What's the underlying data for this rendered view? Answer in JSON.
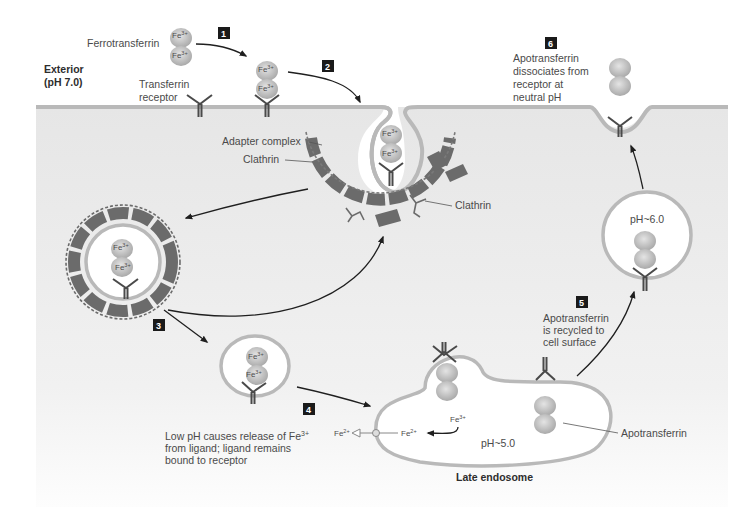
{
  "figure": {
    "regions": {
      "exterior_label_line1": "Exterior",
      "exterior_label_line2": "(pH 7.0)",
      "late_endosome_label": "Late endosome"
    },
    "labels": {
      "ferrotransferrin": "Ferrotransferrin",
      "transferrin_receptor_line1": "Transferrin",
      "transferrin_receptor_line2": "receptor",
      "adapter_complex": "Adapter complex",
      "clathrin_pit": "Clathrin",
      "clathrin_free": "Clathrin",
      "apotransferrin": "Apotransferrin",
      "ph_endosome": "pH~5.0",
      "ph_recycling": "pH~6.0",
      "fe3": "Fe",
      "fe3_sup": "3+",
      "fe2": "Fe",
      "fe2_sup": "2+"
    },
    "steps": [
      {
        "number": "1"
      },
      {
        "number": "2"
      },
      {
        "number": "3"
      },
      {
        "number": "4",
        "caption_lines": [
          "Low pH causes release of Fe",
          "from ligand; ligand remains",
          "bound to receptor"
        ],
        "caption_sup": "3+"
      },
      {
        "number": "5",
        "caption_lines": [
          "Apotransferrin",
          "is recycled to",
          "cell surface"
        ]
      },
      {
        "number": "6",
        "caption_lines": [
          "Apotransferrin",
          "dissociates from",
          "receptor at",
          "neutral pH"
        ]
      }
    ],
    "colors": {
      "cytosol_top": "#e9e9e9",
      "membrane": "#b9b9b9",
      "coat": "#6b6b6b",
      "protein": "#c8c8c8",
      "step_box": "#1a1a1a"
    }
  }
}
